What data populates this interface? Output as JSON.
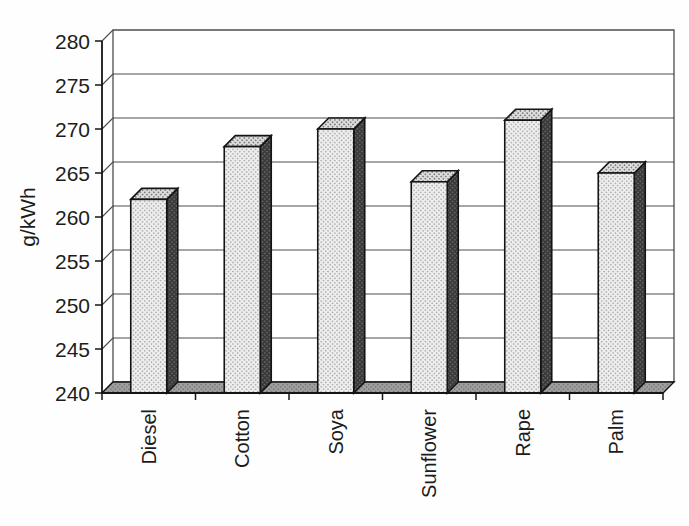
{
  "chart_data": {
    "type": "bar",
    "style": "3d-column-grayscale-scan",
    "title": "",
    "xlabel": "",
    "ylabel": "g/kWh",
    "categories": [
      "Diesel",
      "Cotton",
      "Soya",
      "Sunflower",
      "Rape",
      "Palm"
    ],
    "values": [
      262,
      268,
      270,
      264,
      271,
      265
    ],
    "ylim": [
      240,
      280
    ],
    "ytick_step": 5,
    "yticks": [
      240,
      245,
      250,
      255,
      260,
      265,
      270,
      275,
      280
    ],
    "grid": true,
    "legend": false,
    "category_labels_rotation_deg": 90,
    "colors": {
      "background": "#ffffff",
      "wall": "#ffffff",
      "bar_front": "#d8d8d8",
      "bar_top": "#bdbdbd",
      "bar_side": "#474747",
      "floor": "#8f8f8f",
      "gridline": "#4d4d4d",
      "outline": "#141414",
      "text": "#1c1c1c"
    }
  }
}
